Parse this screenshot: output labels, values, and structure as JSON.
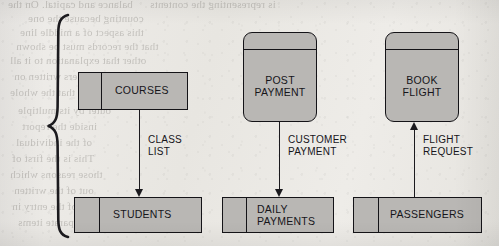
{
  "figure": {
    "caption": "INCORRECT",
    "brace": "left-curly-brace"
  },
  "ghost_text": [
    {
      "text": "balance and capital. On the",
      "x": 8,
      "y": -2
    },
    {
      "text": "is representing the contents",
      "x": 150,
      "y": -2
    },
    {
      "text": "counting because the one",
      "x": 28,
      "y": 12
    },
    {
      "text": "this aspect of a middle line",
      "x": 20,
      "y": 26
    },
    {
      "text": "that the records must be shown",
      "x": 16,
      "y": 40
    },
    {
      "text": "other that explanation to it all",
      "x": 10,
      "y": 54
    },
    {
      "text": "and the numbers written on",
      "x": 14,
      "y": 70
    },
    {
      "text": "every line so that the whole",
      "x": 10,
      "y": 86
    },
    {
      "text": "outer by its multiple",
      "x": 18,
      "y": 104
    },
    {
      "text": "inside the report",
      "x": 22,
      "y": 120
    },
    {
      "text": "of the individual",
      "x": 16,
      "y": 136
    },
    {
      "text": "This is the first of",
      "x": 12,
      "y": 152
    },
    {
      "text": "those reasons which",
      "x": 10,
      "y": 168
    },
    {
      "text": "out of the written",
      "x": 14,
      "y": 184
    },
    {
      "text": "is of the entry in",
      "x": 12,
      "y": 200
    },
    {
      "text": "the separate items",
      "x": 18,
      "y": 216
    },
    {
      "text": "are placed in order",
      "x": 230,
      "y": 214
    }
  ],
  "processes": [
    {
      "id": "post-payment",
      "label": "POST\nPAYMENT",
      "x": 243,
      "y": 32,
      "w": 74,
      "h": 90,
      "rule_y": 16
    },
    {
      "id": "book-flight",
      "label": "BOOK\nFLIGHT",
      "x": 385,
      "y": 32,
      "w": 74,
      "h": 90,
      "rule_y": 16
    }
  ],
  "stores": [
    {
      "id": "courses",
      "label": "COURSES",
      "x": 78,
      "y": 72,
      "w": 110,
      "h": 38,
      "divider_x": 22,
      "label_x": 36
    },
    {
      "id": "students",
      "label": "STUDENTS",
      "x": 74,
      "y": 197,
      "w": 128,
      "h": 36,
      "divider_x": 24,
      "label_x": 38
    },
    {
      "id": "daily-payments",
      "label": "DAILY\nPAYMENTS",
      "x": 222,
      "y": 197,
      "w": 112,
      "h": 36,
      "divider_x": 23,
      "label_x": 34
    },
    {
      "id": "passengers",
      "label": "PASSENGERS",
      "x": 353,
      "y": 197,
      "w": 129,
      "h": 36,
      "divider_x": 24,
      "label_x": 36
    }
  ],
  "flows": [
    {
      "id": "class-list",
      "label": "CLASS\nLIST",
      "direction": "down",
      "x": 139,
      "y_start": 110,
      "y_end": 197,
      "label_x": 148,
      "label_y": 134
    },
    {
      "id": "customer-payment",
      "label": "CUSTOMER\nPAYMENT",
      "direction": "down",
      "x": 279,
      "y_start": 122,
      "y_end": 197,
      "label_x": 288,
      "label_y": 134
    },
    {
      "id": "flight-request",
      "label": "FLIGHT\nREQUEST",
      "direction": "up",
      "x": 414,
      "y_start": 197,
      "y_end": 122,
      "label_x": 423,
      "label_y": 134
    }
  ],
  "colors": {
    "paper": "#eceae6",
    "shape_fill": "#b9b7b4",
    "ink": "#141317"
  }
}
